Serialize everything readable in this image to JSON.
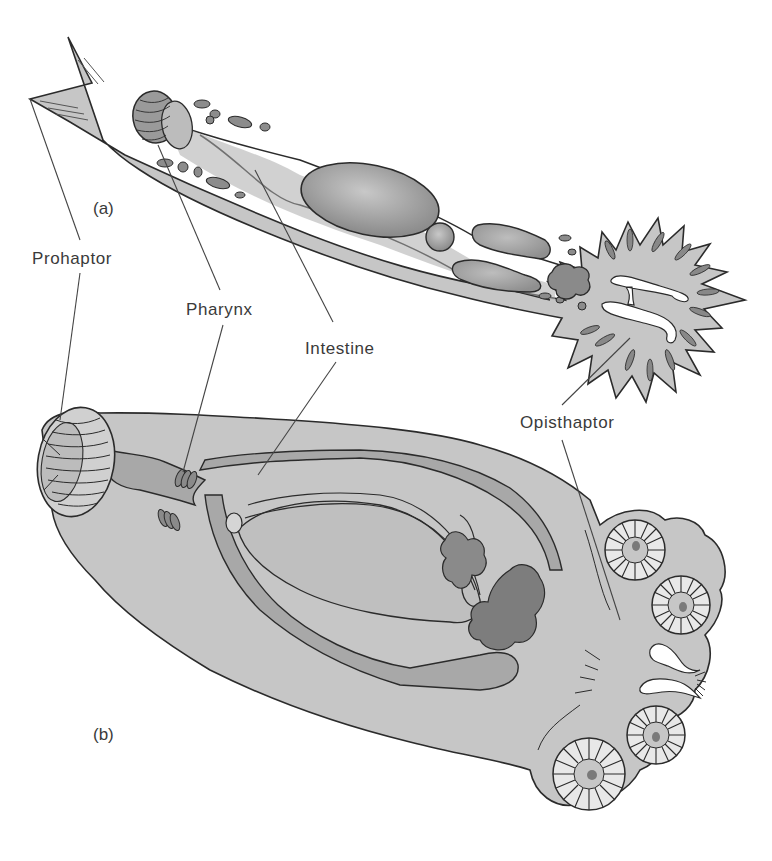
{
  "figure": {
    "type": "anatomical-diagram",
    "panels": [
      {
        "id": "a",
        "label": "(a)"
      },
      {
        "id": "b",
        "label": "(b)"
      }
    ],
    "labels": {
      "prohaptor": "Prohaptor",
      "pharynx": "Pharynx",
      "intestine": "Intestine",
      "opisthaptor": "Opisthaptor"
    },
    "colors": {
      "body_fill": "#c4c4c4",
      "organ_fill": "#9e9e9e",
      "dark_organ_fill": "#7d7d7d",
      "outline": "#2b2b2b",
      "leader_line": "#444444",
      "background": "#ffffff"
    }
  }
}
